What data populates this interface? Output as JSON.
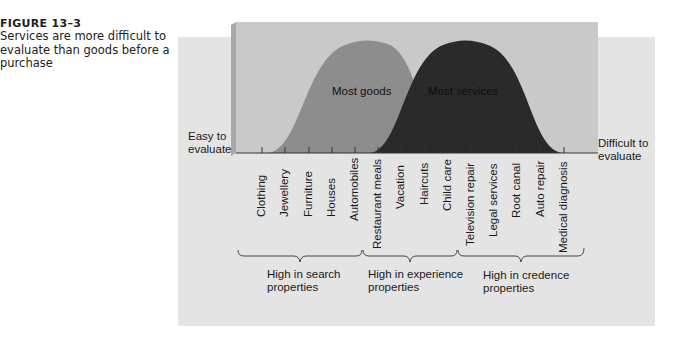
{
  "caption": {
    "figure_number": "FIGURE 13–3",
    "text": "Services are more difficult to evaluate than goods before a purchase"
  },
  "axis": {
    "left_label_line1": "Easy to",
    "left_label_line2": "evaluate",
    "right_label_line1": "Difficult to",
    "right_label_line2": "evaluate"
  },
  "curves": {
    "goods": {
      "label": "Most goods",
      "color": "#8d8d8d"
    },
    "services": {
      "label": "Most services",
      "color": "#2a2a2a"
    }
  },
  "items": [
    "Clothing",
    "Jewellery",
    "Furniture",
    "Houses",
    "Automobiles",
    "Restaurant meals",
    "Vacation",
    "Haircuts",
    "Child care",
    "Television repair",
    "Legal services",
    "Root canal",
    "Auto repair",
    "Medical diagnosis"
  ],
  "groups": [
    {
      "line1": "High in search",
      "line2": "properties"
    },
    {
      "line1": "High in experience",
      "line2": "properties"
    },
    {
      "line1": "High in credence",
      "line2": "properties"
    }
  ],
  "colors": {
    "back_panel": "#e4e4e4",
    "front_box": "#c9c9c9",
    "box_edge": "#a9a9a9"
  }
}
